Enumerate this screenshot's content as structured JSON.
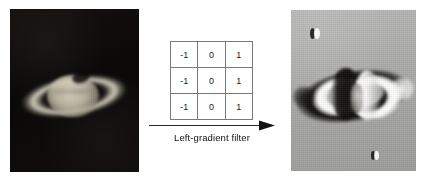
{
  "figure": {
    "background_color": "#ffffff",
    "width": 423,
    "height": 182
  },
  "original_image": {
    "name": "saturn-original-photograph",
    "alt": "Grayscale telescope photograph of Saturn with rings on a dark night-sky background",
    "background_color": "#0e0c0b",
    "subject": "Saturn"
  },
  "kernel": {
    "name": "left-gradient-convolution-kernel",
    "rows": [
      [
        "-1",
        "0",
        "1"
      ],
      [
        "-1",
        "0",
        "1"
      ],
      [
        "-1",
        "0",
        "1"
      ]
    ],
    "border_color": "#6e6e6e",
    "cell_background": "#ffffff"
  },
  "transform": {
    "arrow_label": "Left-gradient filter",
    "arrow_direction": "right",
    "arrow_color": "#2b2b2b"
  },
  "filtered_image": {
    "name": "saturn-left-gradient-filtered",
    "alt": "Result of applying the left-gradient filter: Saturn's rings show dark bands on left edges and bright bands on right edges over a mid-gray field",
    "background_color": "#acacaa",
    "subject": "Saturn",
    "moons": [
      {
        "label": "moon-upper-left"
      },
      {
        "label": "moon-lower-right"
      }
    ]
  }
}
